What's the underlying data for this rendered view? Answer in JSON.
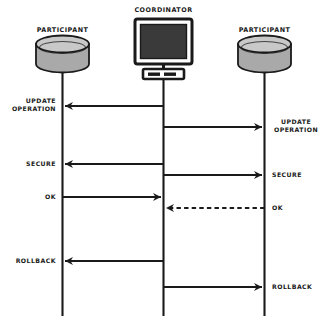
{
  "diagram": {
    "type": "sequence-diagram",
    "background_color": "#ffffff",
    "line_color": "#1a1a1a",
    "fill_gray": "#a9a9a9",
    "screen_color": "#3a3a3a",
    "actors": [
      {
        "id": "participant-left",
        "label": "PARTICIPANT",
        "icon": "database-cylinder-icon",
        "x": 62
      },
      {
        "id": "coordinator",
        "label": "COORDINATOR",
        "icon": "computer-monitor-icon",
        "x": 163
      },
      {
        "id": "participant-right",
        "label": "PARTICIPANT",
        "icon": "database-cylinder-icon",
        "x": 264
      }
    ],
    "messages": [
      {
        "id": "msg-update-operation-left",
        "label": "UPDATE\nOPERATION",
        "from": "coordinator",
        "to": "participant-left",
        "direction": "left",
        "style": "solid",
        "y": 106,
        "label_side": "left"
      },
      {
        "id": "msg-update-operation-right",
        "label": "UPDATE\nOPERATION",
        "from": "coordinator",
        "to": "participant-right",
        "direction": "right",
        "style": "solid",
        "y": 127,
        "label_side": "right"
      },
      {
        "id": "msg-secure-left",
        "label": "SECURE",
        "from": "coordinator",
        "to": "participant-left",
        "direction": "left",
        "style": "solid",
        "y": 164,
        "label_side": "left"
      },
      {
        "id": "msg-secure-right",
        "label": "SECURE",
        "from": "coordinator",
        "to": "participant-right",
        "direction": "right",
        "style": "solid",
        "y": 175,
        "label_side": "right"
      },
      {
        "id": "msg-ok-left",
        "label": "OK",
        "from": "participant-left",
        "to": "coordinator",
        "direction": "right",
        "style": "solid",
        "y": 197,
        "label_side": "left"
      },
      {
        "id": "msg-ok-right",
        "label": "OK",
        "from": "participant-right",
        "to": "coordinator",
        "direction": "left",
        "style": "dashed",
        "y": 208,
        "label_side": "right"
      },
      {
        "id": "msg-rollback-left",
        "label": "ROLLBACK",
        "from": "coordinator",
        "to": "participant-left",
        "direction": "left",
        "style": "solid",
        "y": 261,
        "label_side": "left"
      },
      {
        "id": "msg-rollback-right",
        "label": "ROLLBACK",
        "from": "coordinator",
        "to": "participant-right",
        "direction": "right",
        "style": "solid",
        "y": 287,
        "label_side": "right"
      }
    ]
  },
  "labels": {
    "participant_left_title": "PARTICIPANT",
    "coordinator_title": "COORDINATOR",
    "participant_right_title": "PARTICIPANT",
    "update_operation_left": "UPDATE\nOPERATION",
    "update_operation_right": "UPDATE\nOPERATION",
    "secure_left": "SECURE",
    "secure_right": "SECURE",
    "ok_left": "OK",
    "ok_right": "OK",
    "rollback_left": "ROLLBACK",
    "rollback_right": "ROLLBACK"
  }
}
